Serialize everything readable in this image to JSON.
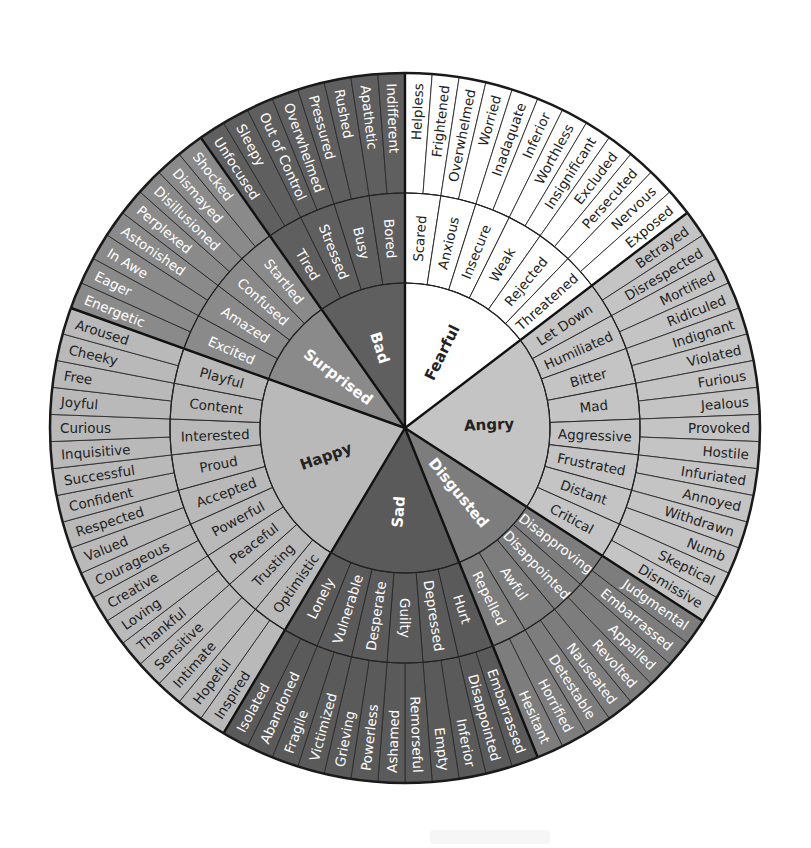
{
  "diagram": {
    "type": "feelings-wheel",
    "center": [
      405,
      428
    ],
    "radii": {
      "core": 145,
      "middle": 235,
      "outer": 355
    },
    "start_angle_deg": -90,
    "categories": [
      {
        "name": "Fearful",
        "fill": "#ffffff",
        "text": "#222222",
        "middle": [
          {
            "name": "Scared",
            "outer": [
              "Helpless",
              "Frightened"
            ]
          },
          {
            "name": "Anxious",
            "outer": [
              "Overwhelmed",
              "Worried"
            ]
          },
          {
            "name": "Insecure",
            "outer": [
              "Inadaquate",
              "Inferior"
            ]
          },
          {
            "name": "Weak",
            "outer": [
              "Worthless",
              "Insignificant"
            ]
          },
          {
            "name": "Rejected",
            "outer": [
              "Excluded",
              "Persecuted"
            ]
          },
          {
            "name": "Threatened",
            "outer": [
              "Nervous",
              "Exposed"
            ]
          }
        ]
      },
      {
        "name": "Angry",
        "fill": "#c4c4c4",
        "text": "#222222",
        "middle": [
          {
            "name": "Let Down",
            "outer": [
              "Betrayed",
              "Disrespected"
            ]
          },
          {
            "name": "Humiliated",
            "outer": [
              "Mortified",
              "Ridiculed"
            ]
          },
          {
            "name": "Bitter",
            "outer": [
              "Indignant",
              "Violated"
            ]
          },
          {
            "name": "Mad",
            "outer": [
              "Furious",
              "Jealous"
            ]
          },
          {
            "name": "Aggressive",
            "outer": [
              "Provoked",
              "Hostile"
            ]
          },
          {
            "name": "Frustrated",
            "outer": [
              "Infuriated",
              "Annoyed"
            ]
          },
          {
            "name": "Distant",
            "outer": [
              "Withdrawn",
              "Numb"
            ]
          },
          {
            "name": "Critical",
            "outer": [
              "Skeptical",
              "Dismissive"
            ]
          }
        ]
      },
      {
        "name": "Disgusted",
        "fill": "#7d7d7d",
        "text": "#ffffff",
        "middle": [
          {
            "name": "Disapproving",
            "outer": [
              "Judgmental",
              "Embarrassed"
            ]
          },
          {
            "name": "Disappointed",
            "outer": [
              "Appalled",
              "Revolted"
            ]
          },
          {
            "name": "Awful",
            "outer": [
              "Nauseated",
              "Detestable"
            ]
          },
          {
            "name": "Repelled",
            "outer": [
              "Horrified",
              "Hesitant"
            ]
          }
        ]
      },
      {
        "name": "Sad",
        "fill": "#5a5a5a",
        "text": "#ffffff",
        "middle": [
          {
            "name": "Hurt",
            "outer": [
              "Embarrassed",
              "Disappointed"
            ]
          },
          {
            "name": "Depressed",
            "outer": [
              "Inferior",
              "Empty"
            ]
          },
          {
            "name": "Guilty",
            "outer": [
              "Remorseful",
              "Ashamed"
            ]
          },
          {
            "name": "Desperate",
            "outer": [
              "Powerless",
              "Grieving"
            ]
          },
          {
            "name": "Vulnerable",
            "outer": [
              "Victimized",
              "Fragile"
            ]
          },
          {
            "name": "Lonely",
            "outer": [
              "Abandoned",
              "Isolated"
            ]
          }
        ]
      },
      {
        "name": "Happy",
        "fill": "#b9b9b9",
        "text": "#222222",
        "middle": [
          {
            "name": "Optimistic",
            "outer": [
              "Inspired",
              "Hopeful"
            ]
          },
          {
            "name": "Trusting",
            "outer": [
              "Intimate",
              "Sensitive"
            ]
          },
          {
            "name": "Peaceful",
            "outer": [
              "Thankful",
              "Loving"
            ]
          },
          {
            "name": "Powerful",
            "outer": [
              "Creative",
              "Courageous"
            ]
          },
          {
            "name": "Accepted",
            "outer": [
              "Valued",
              "Respected"
            ]
          },
          {
            "name": "Proud",
            "outer": [
              "Confident",
              "Successful"
            ]
          },
          {
            "name": "Interested",
            "outer": [
              "Inquisitive",
              "Curious"
            ]
          },
          {
            "name": "Content",
            "outer": [
              "Joyful",
              "Free"
            ]
          },
          {
            "name": "Playful",
            "outer": [
              "Cheeky",
              "Aroused"
            ]
          }
        ]
      },
      {
        "name": "Surprised",
        "fill": "#8a8a8a",
        "text": "#ffffff",
        "middle": [
          {
            "name": "Excited",
            "outer": [
              "Energetic",
              "Eager"
            ]
          },
          {
            "name": "Amazed",
            "outer": [
              "In Awe",
              "Astonished"
            ]
          },
          {
            "name": "Confused",
            "outer": [
              "Perplexed",
              "Disillusioned"
            ]
          },
          {
            "name": "Startled",
            "outer": [
              "Dismayed",
              "Shocked"
            ]
          }
        ]
      },
      {
        "name": "Bad",
        "fill": "#5f5f5f",
        "text": "#ffffff",
        "middle": [
          {
            "name": "Tired",
            "outer": [
              "Unfocused",
              "Sleepy"
            ]
          },
          {
            "name": "Stressed",
            "outer": [
              "Out of Control",
              "Overwhelmed"
            ]
          },
          {
            "name": "Busy",
            "outer": [
              "Pressured",
              "Rushed"
            ]
          },
          {
            "name": "Bored",
            "outer": [
              "Apathetic",
              "Indifferent"
            ]
          }
        ]
      }
    ]
  }
}
